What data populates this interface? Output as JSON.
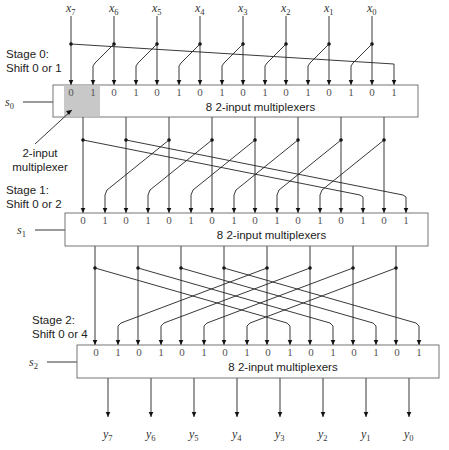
{
  "inputs": [
    "x7",
    "x6",
    "x5",
    "x4",
    "x3",
    "x2",
    "x1",
    "x0"
  ],
  "outputs": [
    "y7",
    "y6",
    "y5",
    "y4",
    "y3",
    "y2",
    "y1",
    "y0"
  ],
  "stages": [
    {
      "title": "Stage 0:",
      "subtitle": "Shift 0 or 1",
      "select": "s0",
      "mux_label": "8  2-input multiplexers",
      "shift": 1
    },
    {
      "title": "Stage 1:",
      "subtitle": "Shift 0 or 2",
      "select": "s1",
      "mux_label": "8  2-input multiplexers",
      "shift": 2
    },
    {
      "title": "Stage 2:",
      "subtitle": "Shift 0 or 4",
      "select": "s2",
      "mux_label": "8  2-input multiplexers",
      "shift": 4
    }
  ],
  "mux_input_labels": [
    "0",
    "1"
  ],
  "callout": {
    "line1": "2-input",
    "line2": "multiplexer"
  },
  "colors": {
    "highlight": "#c8c8c8",
    "line": "#222222",
    "box_border": "#666666"
  }
}
